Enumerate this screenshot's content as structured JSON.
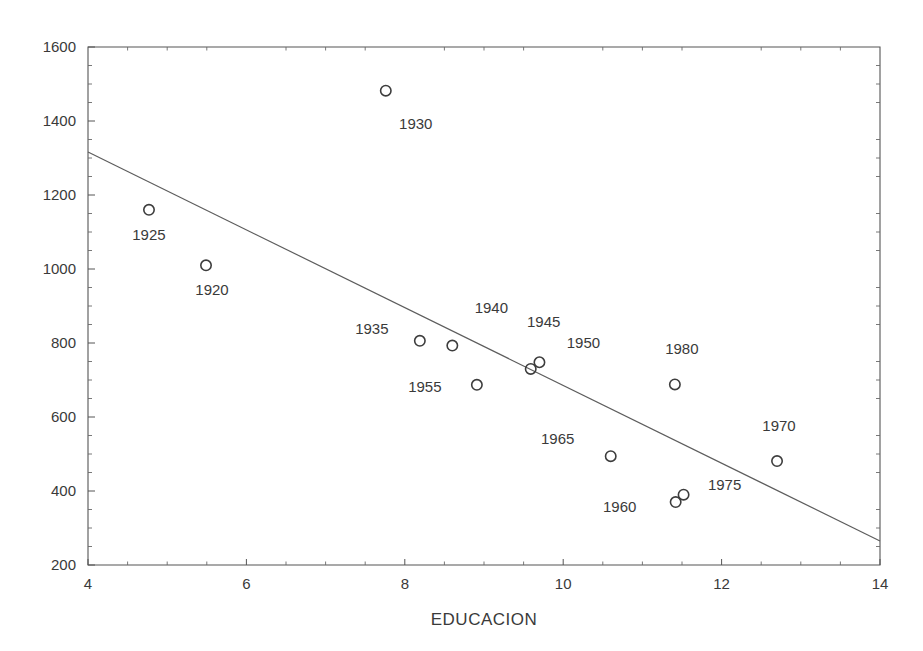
{
  "chart_data": {
    "type": "scatter",
    "title": "",
    "subtitle": "",
    "xlabel": "EDUCACION",
    "ylabel": "",
    "xlim": [
      4,
      14
    ],
    "ylim": [
      200,
      1600
    ],
    "x_ticks": [
      4,
      6,
      8,
      10,
      12,
      14
    ],
    "x_tick_labels": [
      "4",
      "6",
      "8",
      "10",
      "12",
      "14"
    ],
    "x_minor_step": 0.5,
    "y_ticks": [
      200,
      400,
      600,
      800,
      1000,
      1200,
      1400,
      1600
    ],
    "y_tick_labels": [
      "200",
      "400",
      "600",
      "800",
      "1000",
      "1200",
      "1400",
      "1600"
    ],
    "y_minor_step": 50,
    "grid": false,
    "legend": "none",
    "marker_style": "open-circle",
    "marker_color": "#3d3d3d",
    "line_color": "#5d5d5d",
    "points": [
      {
        "label": "1920",
        "x": 5.49,
        "y": 1010,
        "label_dx": 6,
        "label_dy": 30,
        "label_anchor": "middle"
      },
      {
        "label": "1925",
        "x": 4.77,
        "y": 1160,
        "label_dx": 0,
        "label_dy": 30,
        "label_anchor": "middle"
      },
      {
        "label": "1930",
        "x": 7.76,
        "y": 1482,
        "label_dx": 30,
        "label_dy": 38,
        "label_anchor": "middle"
      },
      {
        "label": "1935",
        "x": 8.19,
        "y": 806,
        "label_dx": -48,
        "label_dy": -7,
        "label_anchor": "middle"
      },
      {
        "label": "1940",
        "x": 8.6,
        "y": 793,
        "label_dx": 39,
        "label_dy": -33,
        "label_anchor": "middle"
      },
      {
        "label": "1945",
        "x": 9.59,
        "y": 730,
        "label_dx": 13,
        "label_dy": -42,
        "label_anchor": "middle"
      },
      {
        "label": "1950",
        "x": 9.7,
        "y": 748,
        "label_dx": 44,
        "label_dy": -14,
        "label_anchor": "middle"
      },
      {
        "label": "1955",
        "x": 8.91,
        "y": 687,
        "label_dx": -52,
        "label_dy": 7,
        "label_anchor": "middle"
      },
      {
        "label": "1960",
        "x": 11.42,
        "y": 370,
        "label_dx": -56,
        "label_dy": 10,
        "label_anchor": "middle"
      },
      {
        "label": "1965",
        "x": 10.6,
        "y": 494,
        "label_dx": -53,
        "label_dy": -12,
        "label_anchor": "middle"
      },
      {
        "label": "1970",
        "x": 12.7,
        "y": 481,
        "label_dx": 2,
        "label_dy": -30,
        "label_anchor": "middle"
      },
      {
        "label": "1975",
        "x": 11.52,
        "y": 390,
        "label_dx": 41,
        "label_dy": -5,
        "label_anchor": "middle"
      },
      {
        "label": "1980",
        "x": 11.41,
        "y": 688,
        "label_dx": 7,
        "label_dy": -30,
        "label_anchor": "middle"
      }
    ],
    "trend_line": {
      "x_start": 4,
      "y_start": 1316,
      "x_end": 14,
      "y_end": 265
    }
  }
}
